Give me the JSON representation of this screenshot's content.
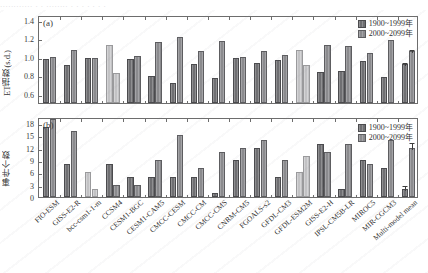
{
  "topstrip": {
    "text": "............ . .   ........ .  .     .      .        .     .       ."
  },
  "legend": {
    "historical_label": "1900~1999年",
    "future_label": "2000~2099年"
  },
  "colors": {
    "historical": "#6f6f72",
    "future": "#8b8b8e",
    "highlight": "#c2c2c4",
    "axis": "#6d6d6d",
    "text": "#2f2f2f"
  },
  "models": [
    "FIO-ESM",
    "GISS-E2-R",
    "bcc-csm1-1-m",
    "CCSM4",
    "CESM1-BGC",
    "CESM1-CAM5",
    "CMCC-CESM",
    "CMCC-CM",
    "CMCC-CMS",
    "CNRM-CM5",
    "FGOALS-s2",
    "GFDL-CM3",
    "GFDL-ESM2M",
    "GISS-E2-H",
    "IPSL-CM5B-LR",
    "MIROC5",
    "MIR-CGCM3",
    "Multi-model mean"
  ],
  "chart_data": [
    {
      "type": "bar",
      "panel": "a",
      "panel_tag": "(a)",
      "title": "",
      "xlabel": "",
      "ylabel": "ET指数(s.d.)",
      "ylim": [
        0.5,
        1.45
      ],
      "yticks": [
        0.6,
        0.8,
        1.0,
        1.2,
        1.4
      ],
      "ytick_labels": [
        "0.6",
        "0.8",
        "1.0",
        "1.2",
        "1.4"
      ],
      "grid": false,
      "legend_position": "top-right",
      "categories": [
        "FIO-ESM",
        "GISS-E2-R",
        "bcc-csm1-1-m",
        "CCSM4",
        "CESM1-BGC",
        "CESM1-CAM5",
        "CMCC-CESM",
        "CMCC-CM",
        "CMCC-CMS",
        "CNRM-CM5",
        "FGOALS-s2",
        "GFDL-CM3",
        "GFDL-ESM2M",
        "GISS-E2-H",
        "IPSL-CM5B-LR",
        "MIROC5",
        "MIR-CGCM3",
        "Multi-model mean"
      ],
      "series": [
        {
          "name": "1900~1999年",
          "values": [
            0.98,
            0.91,
            0.99,
            1.13,
            0.98,
            0.79,
            0.72,
            0.92,
            0.77,
            0.99,
            0.93,
            0.96,
            1.07,
            0.84,
            0.85,
            0.95,
            0.78,
            0.92
          ],
          "highlight_indices": [
            3,
            12
          ]
        },
        {
          "name": "2000~2099年",
          "values": [
            1.0,
            1.07,
            0.99,
            0.82,
            1.01,
            1.16,
            1.21,
            1.06,
            1.17,
            1.0,
            1.06,
            1.02,
            0.91,
            1.13,
            1.12,
            1.04,
            1.18,
            1.06
          ],
          "highlight_indices": [
            3,
            12
          ]
        }
      ],
      "error_bars": {
        "category": "Multi-model mean",
        "historical": 0.03,
        "future": 0.03
      }
    },
    {
      "type": "bar",
      "panel": "b",
      "panel_tag": "(b)",
      "title": "",
      "xlabel": "",
      "ylabel": "事件个数",
      "ylim": [
        0,
        19.5
      ],
      "yticks": [
        0,
        3,
        6,
        9,
        12,
        15,
        18
      ],
      "ytick_labels": [
        "0",
        "3",
        "6",
        "9",
        "12",
        "15",
        "18"
      ],
      "grid": false,
      "legend_position": "top-right",
      "categories": [
        "FIO-ESM",
        "GISS-E2-R",
        "bcc-csm1-1-m",
        "CCSM4",
        "CESM1-BGC",
        "CESM1-CAM5",
        "CMCC-CESM",
        "CMCC-CM",
        "CMCC-CMS",
        "CNRM-CM5",
        "FGOALS-s2",
        "GFDL-CM3",
        "GFDL-ESM2M",
        "GISS-E2-H",
        "IPSL-CM5B-LR",
        "MIROC5",
        "MIR-CGCM3",
        "Multi-model mean"
      ],
      "series": [
        {
          "name": "1900~1999年",
          "values": [
            17,
            8,
            6,
            8,
            5,
            5,
            5,
            5,
            1,
            9,
            12,
            5,
            6,
            13,
            2,
            9,
            7,
            2
          ],
          "highlight_indices": [
            2,
            12
          ]
        },
        {
          "name": "2000~2099年",
          "values": [
            19,
            16,
            2,
            3,
            3,
            9,
            15,
            7,
            11,
            12,
            14,
            9,
            10,
            11,
            13,
            8,
            14,
            12
          ],
          "highlight_indices": [
            2,
            12
          ]
        }
      ],
      "error_bars": {
        "category": "Multi-model mean",
        "historical": 1.2,
        "future": 1.6
      }
    }
  ]
}
